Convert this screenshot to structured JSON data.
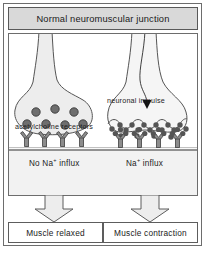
{
  "figure": {
    "title": "Normal neuromuscular junction",
    "colors": {
      "title_bar_fill": "#d9d9d9",
      "frame_stroke": "#6d6d6d",
      "terminal_fill": "#ebebeb",
      "muscle_fill": "#f0f0f0",
      "vesicle_fill": "#6b6b6b",
      "receptor_fill": "#8a8a8a",
      "arrow_fill": "#ededed",
      "text": "#1a1a1a"
    }
  },
  "panel": {
    "left_side": {
      "label_acetylcholine_receptors": "acetylcholine  receptors",
      "label_influx": "No Na+ influx",
      "influx_prefix": "No Na",
      "influx_sup": "+",
      "influx_suffix": " influx",
      "vesicle_count": 7,
      "receptor_count": 4,
      "receptors_occupied": false
    },
    "right_side": {
      "label_neuronal_impulse": "neuronal  impulse",
      "label_influx": "Na+ influx",
      "influx_prefix": "Na",
      "influx_sup": "+",
      "influx_suffix": " influx",
      "free_transmitter_count": 18,
      "receptor_count": 4,
      "receptors_occupied": true
    }
  },
  "results": {
    "left": "Muscle  relaxed",
    "right": "Muscle  contraction"
  },
  "icons": {
    "impulse_arrow": "downward-arrow-icon",
    "block_arrow_left": "block-arrow-down-icon",
    "block_arrow_right": "block-arrow-down-icon"
  }
}
